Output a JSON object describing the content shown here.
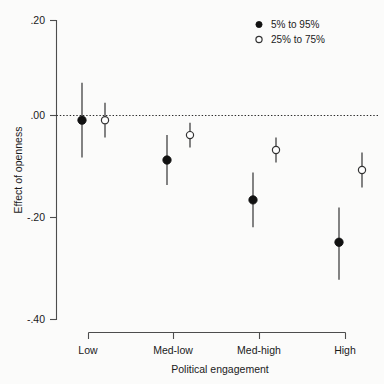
{
  "chart_data": {
    "type": "scatter",
    "title": "",
    "xlabel": "Political engagement",
    "ylabel": "Effect of openness",
    "categories": [
      "Low",
      "Med-low",
      "Med-high",
      "High"
    ],
    "ylim": [
      -0.4,
      0.2
    ],
    "yticks": [
      0.2,
      0.0,
      -0.2,
      -0.4
    ],
    "ytick_labels": [
      ".20",
      ".00",
      "-.20",
      "-.40"
    ],
    "grid": false,
    "zero_reference_line": 0.0,
    "legend_position": "top-right",
    "series": [
      {
        "name": "5% to 95%",
        "marker": "filled-circle",
        "values": [
          0.0,
          -0.08,
          -0.16,
          -0.245
        ],
        "lower": [
          -0.075,
          -0.13,
          -0.215,
          -0.32
        ],
        "upper": [
          0.075,
          -0.03,
          -0.105,
          -0.175
        ]
      },
      {
        "name": "25% to 75%",
        "marker": "open-circle",
        "values": [
          0.0,
          -0.03,
          -0.06,
          -0.1
        ],
        "lower": [
          -0.035,
          -0.055,
          -0.085,
          -0.135
        ],
        "upper": [
          0.035,
          -0.005,
          -0.035,
          -0.065
        ]
      }
    ]
  },
  "legend": {
    "entries": [
      {
        "label": "5% to 95%",
        "marker": "filled-circle"
      },
      {
        "label": "25% to 75%",
        "marker": "open-circle"
      }
    ]
  },
  "axes": {
    "y": {
      "title": "Effect of openness",
      "ticks": [
        ".20",
        ".00",
        "-.20",
        "-.40"
      ]
    },
    "x": {
      "title": "Political engagement",
      "ticks": [
        "Low",
        "Med-low",
        "Med-high",
        "High"
      ]
    }
  },
  "colors": {
    "filled_marker": "#111111",
    "open_marker": "#ffffff",
    "marker_stroke": "#333333",
    "axis": "#4d4d4d",
    "zero_line": "#2b2b2b",
    "background": "#fbfbfa"
  }
}
